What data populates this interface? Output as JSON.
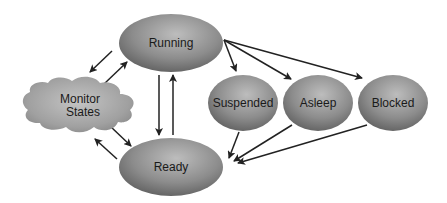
{
  "diagram": {
    "type": "state-transition",
    "nodes": [
      {
        "id": "running",
        "label": "Running",
        "shape": "ellipse"
      },
      {
        "id": "ready",
        "label": "Ready",
        "shape": "ellipse"
      },
      {
        "id": "monitor",
        "label_line1": "Monitor",
        "label_line2": "States",
        "shape": "cloud"
      },
      {
        "id": "suspended",
        "label": "Suspended",
        "shape": "ellipse"
      },
      {
        "id": "asleep",
        "label": "Asleep",
        "shape": "ellipse"
      },
      {
        "id": "blocked",
        "label": "Blocked",
        "shape": "ellipse"
      }
    ],
    "edges": [
      {
        "from": "running",
        "to": "monitor"
      },
      {
        "from": "monitor",
        "to": "running"
      },
      {
        "from": "monitor",
        "to": "ready"
      },
      {
        "from": "ready",
        "to": "monitor"
      },
      {
        "from": "running",
        "to": "ready"
      },
      {
        "from": "ready",
        "to": "running"
      },
      {
        "from": "running",
        "to": "suspended"
      },
      {
        "from": "running",
        "to": "asleep"
      },
      {
        "from": "running",
        "to": "blocked"
      },
      {
        "from": "suspended",
        "to": "ready"
      },
      {
        "from": "asleep",
        "to": "ready"
      },
      {
        "from": "blocked",
        "to": "ready"
      }
    ],
    "colors": {
      "node_fill": "#8a8a8a",
      "node_highlight": "#b5b5b5",
      "node_shadow": "#5a5a5a",
      "arrow": "#222222",
      "text": "#1a1a1a"
    }
  }
}
